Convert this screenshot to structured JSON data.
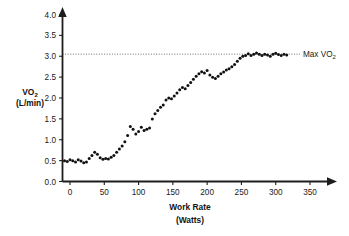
{
  "chart_data": {
    "type": "scatter",
    "title": "",
    "xlabel": "Work Rate",
    "xlabel_units": "(Watts)",
    "ylabel": "VO",
    "ylabel_sub": "2",
    "ylabel_units": "(L/min)",
    "xlim": [
      -12,
      370
    ],
    "ylim": [
      0.0,
      4.0
    ],
    "xticks": [
      0,
      50,
      100,
      150,
      200,
      250,
      300,
      350
    ],
    "xticklabels": [
      "0",
      "50",
      "100",
      "150",
      "200",
      "250",
      "300",
      "350"
    ],
    "yticks": [
      0.0,
      0.5,
      1.0,
      1.5,
      2.0,
      2.5,
      3.0,
      3.5,
      4.0
    ],
    "yticklabels": [
      "0.0",
      "0.5",
      "1.0",
      "1.5",
      "2.0",
      "2.5",
      "3.0",
      "3.5",
      "4.0"
    ],
    "grid": false,
    "legend": "none",
    "marker": "filled-circle",
    "marker_color": "#111111",
    "annotations": [
      {
        "name": "max-vo2-line",
        "kind": "horizontal-dotted-line",
        "y": 3.05,
        "label": "Max VO",
        "label_sub": "2",
        "color": "#4d4d4d"
      }
    ],
    "series": [
      {
        "name": "VO2 uptake",
        "x": [
          -8,
          -4,
          0,
          4,
          8,
          12,
          16,
          20,
          24,
          28,
          32,
          36,
          40,
          44,
          48,
          52,
          56,
          60,
          64,
          68,
          72,
          76,
          80,
          84,
          88,
          92,
          96,
          100,
          104,
          108,
          112,
          116,
          120,
          124,
          128,
          132,
          136,
          140,
          144,
          148,
          152,
          156,
          160,
          164,
          168,
          172,
          176,
          180,
          184,
          188,
          192,
          196,
          200,
          204,
          208,
          212,
          216,
          220,
          224,
          228,
          232,
          236,
          240,
          244,
          248,
          252,
          256,
          260,
          264,
          268,
          272,
          276,
          280,
          284,
          288,
          292,
          296,
          300,
          304,
          308,
          312,
          316
        ],
        "y": [
          0.5,
          0.48,
          0.52,
          0.5,
          0.47,
          0.52,
          0.49,
          0.45,
          0.47,
          0.55,
          0.62,
          0.7,
          0.65,
          0.57,
          0.53,
          0.55,
          0.54,
          0.58,
          0.62,
          0.7,
          0.78,
          0.85,
          0.95,
          1.1,
          1.32,
          1.25,
          1.14,
          1.2,
          1.3,
          1.22,
          1.25,
          1.28,
          1.5,
          1.62,
          1.7,
          1.78,
          1.83,
          1.95,
          2.0,
          1.98,
          2.05,
          2.12,
          2.2,
          2.25,
          2.22,
          2.3,
          2.37,
          2.45,
          2.52,
          2.58,
          2.63,
          2.6,
          2.66,
          2.55,
          2.5,
          2.47,
          2.52,
          2.58,
          2.62,
          2.67,
          2.7,
          2.75,
          2.8,
          2.88,
          2.95,
          3.0,
          3.02,
          3.06,
          3.02,
          3.05,
          3.08,
          3.05,
          3.02,
          3.05,
          3.03,
          3.0,
          3.05,
          3.07,
          3.04,
          3.02,
          3.05,
          3.03
        ]
      }
    ]
  }
}
